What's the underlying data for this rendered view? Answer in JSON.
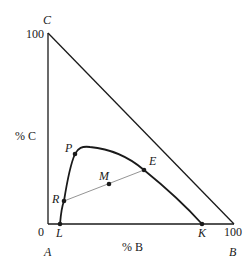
{
  "diagram": {
    "type": "ternary-phase-diagram",
    "vertices": {
      "top": "C",
      "bottom_left": "A",
      "bottom_right": "B"
    },
    "axis_labels": {
      "vertical": "% C",
      "horizontal": "% B"
    },
    "ticks": {
      "c_max": "100",
      "origin": "0",
      "b_max": "100"
    },
    "points": {
      "P": "P",
      "E": "E",
      "M": "M",
      "R": "R",
      "L": "L",
      "K": "K"
    },
    "colors": {
      "outline": "#1a1a1a",
      "tie_line": "#888888",
      "background": "#ffffff"
    }
  }
}
